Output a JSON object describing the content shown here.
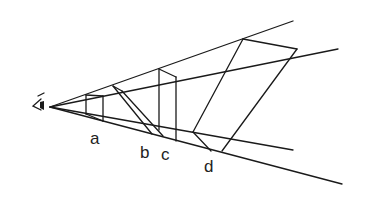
{
  "diagram": {
    "type": "perspective-projection",
    "observer": "eye-icon",
    "labels": [
      {
        "id": "a",
        "text": "a",
        "x": 90,
        "y": 144
      },
      {
        "id": "b",
        "text": "b",
        "x": 140,
        "y": 158
      },
      {
        "id": "c",
        "text": "c",
        "x": 161,
        "y": 160
      },
      {
        "id": "d",
        "text": "d",
        "x": 204,
        "y": 172
      }
    ],
    "apex": [
      50,
      107
    ],
    "rays": [
      {
        "name": "ray-top-outer",
        "end": [
          293,
          21
        ]
      },
      {
        "name": "ray-top-inner",
        "end": [
          338,
          49
        ]
      },
      {
        "name": "ray-bottom-inner",
        "end": [
          293,
          150
        ]
      },
      {
        "name": "ray-bottom-outer",
        "end": [
          342,
          184
        ]
      }
    ]
  }
}
